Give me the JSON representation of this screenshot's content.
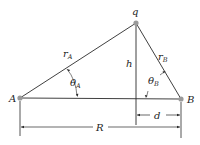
{
  "diagram": {
    "colors": {
      "line": "#2a2a2a",
      "dot": "#9a9a9a",
      "background": "#ffffff"
    },
    "points": {
      "A": {
        "label": "A",
        "x": 20,
        "y": 98
      },
      "B": {
        "label": "B",
        "x": 181,
        "y": 99
      },
      "q": {
        "label": "q",
        "x": 136,
        "y": 23
      }
    },
    "labels": {
      "rA": {
        "main": "r",
        "sub": "A"
      },
      "rB": {
        "main": "r",
        "sub": "B"
      },
      "h": "h",
      "thetaA": {
        "main": "θ",
        "sub": "A"
      },
      "thetaB": {
        "main": "θ",
        "sub": "B"
      },
      "d": "d",
      "R": "R"
    }
  }
}
